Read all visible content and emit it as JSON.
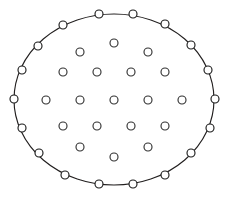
{
  "figure": {
    "background_color": "#ffffff",
    "width": 228,
    "height": 200
  },
  "boundary": {
    "shape": "ellipse",
    "center_x": 114,
    "center_y": 99.5,
    "radius_x": 100,
    "radius_y": 85.5,
    "stroke_color": "#221f1f",
    "stroke_width": 1.15
  },
  "node_style": {
    "radius": 4.0,
    "fill_color": "#ffffff",
    "stroke_color": "#2b2b2b",
    "stroke_width": 1.15
  },
  "chart_data": {
    "type": "scatter",
    "xlabel": "",
    "ylabel": "",
    "xlim": [
      0,
      228
    ],
    "ylim": [
      0,
      200
    ],
    "grid": false,
    "legend": false,
    "boundary_curve": {
      "type": "ellipse",
      "cx": 114,
      "cy": 99.5,
      "rx": 100,
      "ry": 85.5
    },
    "series": [
      {
        "name": "boundary-nodes",
        "count": 24,
        "marker": "open-circle",
        "points": [
          [
            99,
            14
          ],
          [
            133,
            14
          ],
          [
            165,
            24
          ],
          [
            191,
            45
          ],
          [
            208,
            70
          ],
          [
            215,
            99
          ],
          [
            210,
            128
          ],
          [
            191,
            153
          ],
          [
            165,
            175
          ],
          [
            133,
            184
          ],
          [
            99,
            184
          ],
          [
            65,
            175
          ],
          [
            39,
            153
          ],
          [
            22,
            128
          ],
          [
            14,
            99
          ],
          [
            22,
            70
          ],
          [
            38,
            46
          ],
          [
            63,
            25
          ],
          [
            81,
            17
          ],
          [
            116,
            15
          ],
          [
            150,
            18
          ],
          [
            180,
            34
          ],
          [
            48,
            34
          ],
          [
            202,
            143
          ]
        ]
      },
      {
        "name": "interior-nodes",
        "count": 27,
        "marker": "open-circle",
        "points": [
          [
            114,
            43
          ],
          [
            80,
            52
          ],
          [
            148,
            52
          ],
          [
            63,
            72
          ],
          [
            97,
            72
          ],
          [
            131,
            72
          ],
          [
            165,
            72
          ],
          [
            46,
            100
          ],
          [
            80,
            100
          ],
          [
            114,
            100
          ],
          [
            148,
            100
          ],
          [
            182,
            100
          ],
          [
            63,
            126
          ],
          [
            97,
            126
          ],
          [
            131,
            126
          ],
          [
            165,
            126
          ],
          [
            80,
            147
          ],
          [
            148,
            147
          ],
          [
            114,
            157
          ]
        ]
      }
    ]
  },
  "nodes": {
    "boundary": [
      {
        "id": "b1",
        "x": 99,
        "y": 14
      },
      {
        "id": "b2",
        "x": 133,
        "y": 14
      },
      {
        "id": "b3",
        "x": 165,
        "y": 24
      },
      {
        "id": "b4",
        "x": 191,
        "y": 45
      },
      {
        "id": "b5",
        "x": 208,
        "y": 70
      },
      {
        "id": "b6",
        "x": 215,
        "y": 99
      },
      {
        "id": "b7",
        "x": 210,
        "y": 128
      },
      {
        "id": "b8",
        "x": 191,
        "y": 153
      },
      {
        "id": "b9",
        "x": 165,
        "y": 175
      },
      {
        "id": "b10",
        "x": 133,
        "y": 184
      },
      {
        "id": "b11",
        "x": 99,
        "y": 184
      },
      {
        "id": "b12",
        "x": 65,
        "y": 175
      },
      {
        "id": "b13",
        "x": 39,
        "y": 153
      },
      {
        "id": "b14",
        "x": 22,
        "y": 128
      },
      {
        "id": "b15",
        "x": 14,
        "y": 99
      },
      {
        "id": "b16",
        "x": 22,
        "y": 70
      },
      {
        "id": "b17",
        "x": 38,
        "y": 46
      },
      {
        "id": "b18",
        "x": 63,
        "y": 25
      }
    ],
    "interior": [
      {
        "id": "i1",
        "x": 114,
        "y": 43
      },
      {
        "id": "i2",
        "x": 80,
        "y": 52
      },
      {
        "id": "i3",
        "x": 148,
        "y": 52
      },
      {
        "id": "i4",
        "x": 63,
        "y": 72
      },
      {
        "id": "i5",
        "x": 97,
        "y": 72
      },
      {
        "id": "i6",
        "x": 131,
        "y": 72
      },
      {
        "id": "i7",
        "x": 165,
        "y": 72
      },
      {
        "id": "i8",
        "x": 46,
        "y": 100
      },
      {
        "id": "i9",
        "x": 80,
        "y": 100
      },
      {
        "id": "i10",
        "x": 114,
        "y": 100
      },
      {
        "id": "i11",
        "x": 148,
        "y": 100
      },
      {
        "id": "i12",
        "x": 182,
        "y": 100
      },
      {
        "id": "i13",
        "x": 63,
        "y": 126
      },
      {
        "id": "i14",
        "x": 97,
        "y": 126
      },
      {
        "id": "i15",
        "x": 131,
        "y": 126
      },
      {
        "id": "i16",
        "x": 165,
        "y": 126
      },
      {
        "id": "i17",
        "x": 80,
        "y": 147
      },
      {
        "id": "i18",
        "x": 148,
        "y": 147
      },
      {
        "id": "i19",
        "x": 114,
        "y": 157
      }
    ]
  }
}
